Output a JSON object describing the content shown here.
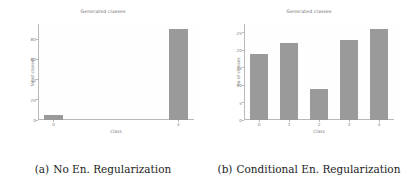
{
  "figure": {
    "panels": [
      {
        "caption_tag": "(a)",
        "caption_text": "No En. Regularization",
        "chart_data": {
          "type": "bar",
          "title": "Generated classes",
          "xlabel": "Class",
          "ylabel": "No of classes",
          "categories": [
            "0",
            "1",
            "2",
            "3",
            "4"
          ],
          "xtick_labels": [
            "0",
            "4"
          ],
          "xtick_positions": [
            0,
            4
          ],
          "ytick_labels": [
            "0",
            "20",
            "40",
            "60",
            "80"
          ],
          "values": [
            5,
            0,
            0,
            0,
            90
          ],
          "ylim": [
            0,
            95
          ],
          "grid": false,
          "legend": "none",
          "bar_color": "#9a9a9a"
        }
      },
      {
        "caption_tag": "(b)",
        "caption_text": "Conditional En. Regularization",
        "chart_data": {
          "type": "bar",
          "title": "Generated classes",
          "xlabel": "Class",
          "ylabel": "No of classes",
          "categories": [
            "0",
            "1",
            "2",
            "3",
            "4"
          ],
          "xtick_labels": [
            "0",
            "1",
            "2",
            "3",
            "4"
          ],
          "xtick_positions": [
            0,
            1,
            2,
            3,
            4
          ],
          "ytick_labels": [
            "0",
            "5",
            "10",
            "15",
            "20",
            "25"
          ],
          "values": [
            19,
            22,
            9,
            23,
            26
          ],
          "ylim": [
            0,
            27.5
          ],
          "grid": false,
          "legend": "none",
          "bar_color": "#9a9a9a"
        }
      }
    ]
  }
}
